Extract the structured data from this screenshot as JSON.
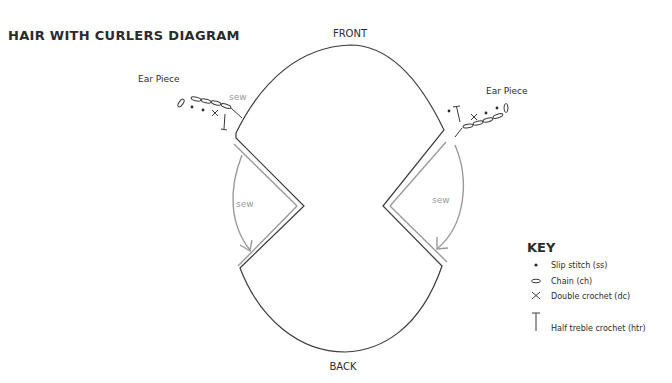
{
  "title": "HAIR WITH CURLERS DIAGRAM",
  "labels": {
    "front": "FRONT",
    "back": "BACK",
    "ear_left": "Ear Piece",
    "ear_right": "Ear Piece",
    "sew_ear_left": "sew",
    "sew_side_left": "sew",
    "sew_side_right": "sew"
  },
  "ear_pieces": {
    "left": [
      "chain",
      "chain",
      "chain",
      "chain",
      "chain",
      "slip-stitch",
      "slip-stitch",
      "double-crochet",
      "half-treble-crochet"
    ],
    "right": [
      "chain",
      "chain",
      "chain",
      "chain",
      "chain",
      "slip-stitch",
      "slip-stitch",
      "double-crochet",
      "half-treble-crochet"
    ]
  },
  "colors": {
    "outline": "#3a3a3a",
    "seam": "#9a9a9a",
    "text": "#2b2b2b"
  },
  "key": {
    "title": "KEY",
    "items": [
      {
        "icon": "slip-stitch-icon",
        "label": "Slip stitch (ss)"
      },
      {
        "icon": "chain-icon",
        "label": "Chain (ch)"
      },
      {
        "icon": "double-crochet-icon",
        "label": "Double crochet (dc)"
      },
      {
        "icon": "half-treble-crochet-icon",
        "label": "Half treble crochet (htr)"
      }
    ]
  }
}
